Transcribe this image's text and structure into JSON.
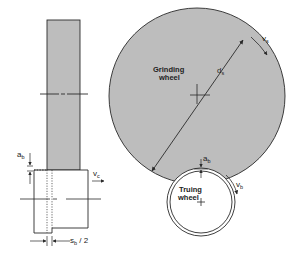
{
  "diagram": {
    "colors": {
      "wheel_fill": "#bdbdbd",
      "stroke": "#2a2a2a",
      "background": "#ffffff"
    },
    "grinding_wheel": {
      "label_line1": "Grinding",
      "label_line2": "wheel",
      "diameter_label": "d",
      "diameter_sub": "s",
      "speed_label": "v",
      "speed_sub": "s"
    },
    "truing_wheel": {
      "label_line1": "Truing",
      "label_line2": "wheel",
      "speed_label": "v",
      "speed_sub": "b"
    },
    "contact": {
      "infeed_label": "a",
      "infeed_sub": "b"
    },
    "side_view": {
      "infeed_label": "a",
      "infeed_sub": "b",
      "feed_label": "v",
      "feed_sub": "c",
      "width_label": "s",
      "width_sub": "b",
      "width_suffix": " / 2"
    }
  }
}
